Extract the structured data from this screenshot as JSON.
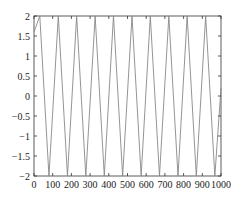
{
  "chart_data": {
    "type": "line",
    "title": "",
    "xlabel": "",
    "ylabel": "",
    "xlim": [
      0,
      1000
    ],
    "ylim": [
      -2,
      2
    ],
    "grid": false,
    "legend": null,
    "x_ticks": [
      "0",
      "100",
      "200",
      "300",
      "400",
      "500",
      "600",
      "700",
      "800",
      "900",
      "1000"
    ],
    "y_ticks": [
      "2",
      "1.5",
      "1",
      "0.5",
      "0",
      "−0.5",
      "−1",
      "−1.5",
      "−2"
    ],
    "series": [
      {
        "name": "signal",
        "color": "#888888",
        "description": "Sinusoid of amplitude 2, period about 98.5 units, spanning x = 0..1000 (about 10 cycles)",
        "x": [
          0,
          31,
          80,
          130,
          179,
          228,
          277,
          327,
          376,
          425,
          474,
          524,
          573,
          622,
          671,
          721,
          770,
          819,
          868,
          918,
          967,
          1000
        ],
        "values": [
          1.6,
          2,
          -2,
          2,
          -2,
          2,
          -2,
          2,
          -2,
          2,
          -2,
          2,
          -2,
          2,
          -2,
          2,
          -2,
          2,
          -2,
          2,
          -2,
          0.2
        ]
      }
    ]
  },
  "colors": {
    "axis": "#333333",
    "line": "#888888",
    "background": "#ffffff"
  }
}
